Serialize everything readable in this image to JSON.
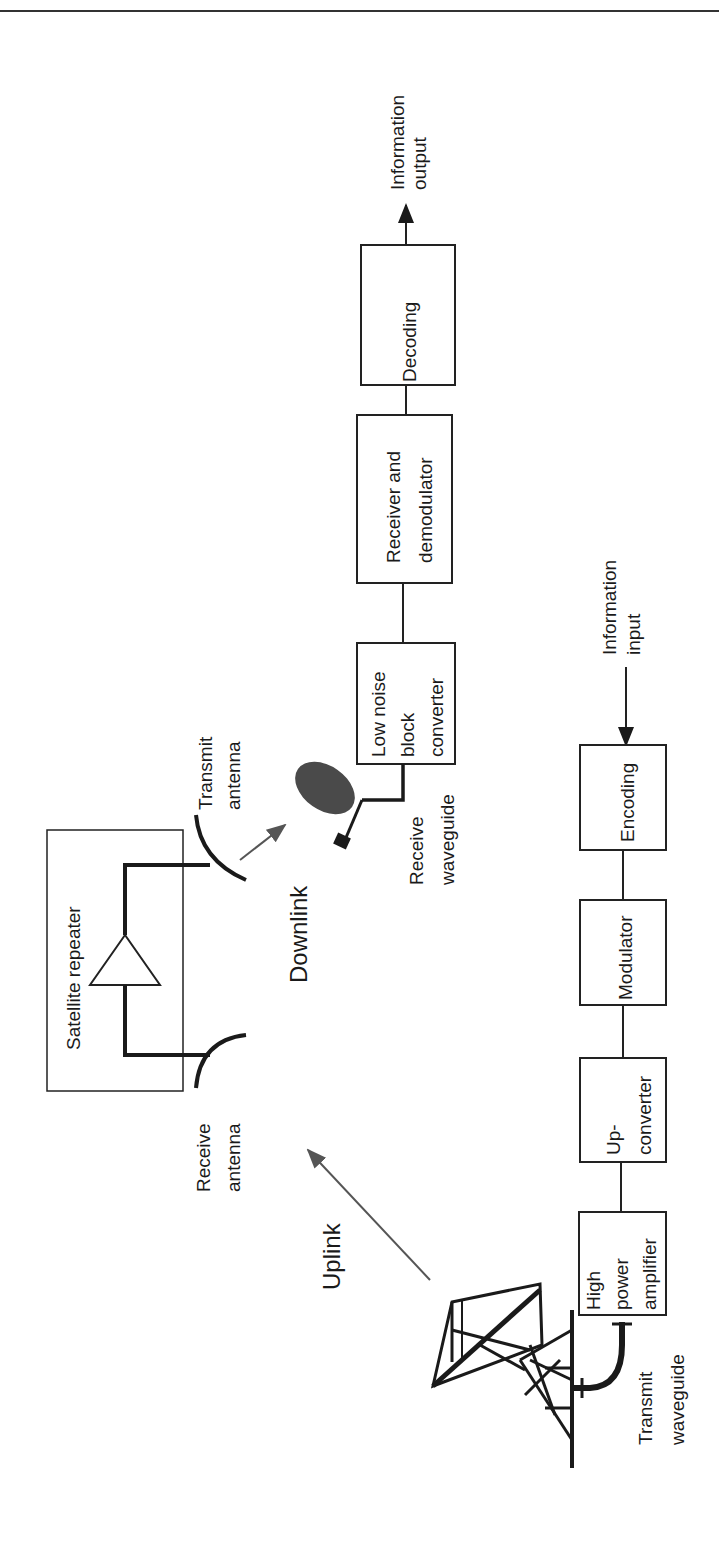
{
  "figure": {
    "orientation": "rotated-90-ccw",
    "top_rule": true,
    "receive_chain": {
      "output_label": [
        "Information",
        "output"
      ],
      "blocks": [
        {
          "id": "decoding",
          "lines": [
            "Decoding"
          ]
        },
        {
          "id": "receiver",
          "lines": [
            "Receiver and",
            "demodulator"
          ]
        },
        {
          "id": "lnb",
          "lines": [
            "Low noise",
            "block",
            "converter"
          ]
        }
      ],
      "waveguide_label": [
        "Receive",
        "waveguide"
      ]
    },
    "satellite": {
      "title": "Satellite repeater",
      "transmit_antenna_label": [
        "Transmit",
        "antenna"
      ],
      "receive_antenna_label": [
        "Receive",
        "antenna"
      ]
    },
    "links": {
      "downlink": "Downlink",
      "uplink": "Uplink"
    },
    "transmit_chain": {
      "input_label": [
        "Information",
        "input"
      ],
      "blocks": [
        {
          "id": "encoding",
          "lines": [
            "Encoding"
          ]
        },
        {
          "id": "modulator",
          "lines": [
            "Modulator"
          ]
        },
        {
          "id": "upconverter",
          "lines": [
            "Up-",
            "converter"
          ]
        },
        {
          "id": "hpa",
          "lines": [
            "High",
            "power",
            "amplifier"
          ]
        }
      ],
      "waveguide_label": [
        "Transmit",
        "waveguide"
      ]
    },
    "colors": {
      "ink": "#1a1a1a",
      "link_arrow": "#555555",
      "dish_fill": "#4a4a4a"
    }
  }
}
